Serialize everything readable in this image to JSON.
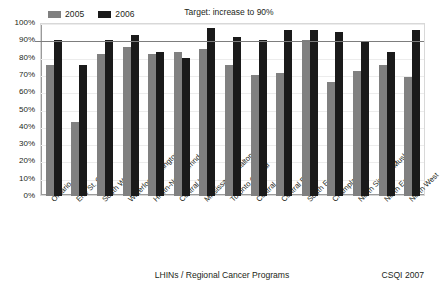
{
  "chart_data": {
    "type": "bar",
    "title": "",
    "annotation": "Target: increase to 90%",
    "xlabel": "LHINs / Regional Cancer Programs",
    "ylabel": "",
    "ylim": [
      0,
      100
    ],
    "ytick_labels": [
      "100%",
      "90%",
      "80%",
      "70%",
      "60%",
      "50%",
      "40%",
      "30%",
      "20%",
      "10%",
      "0%"
    ],
    "ytick_values": [
      100,
      90,
      80,
      70,
      60,
      50,
      40,
      30,
      20,
      10,
      0
    ],
    "grid": true,
    "legend_position": "top-left",
    "target_value": 90,
    "categories": [
      "Ontario",
      "Erie St. Clair",
      "South West",
      "Waterloo-Wellington",
      "Hmltn-Ngr-Hldmnd-Brnt",
      "Central West",
      "Mississauga Halton",
      "Toronto Central",
      "Central",
      "Central East",
      "South East",
      "Champlain",
      "North Simcoe Muskoka",
      "North East",
      "North West"
    ],
    "series": [
      {
        "name": "2005",
        "color": "#808080",
        "values": [
          76,
          43,
          82,
          86,
          82,
          83,
          85,
          76,
          70,
          71,
          90,
          66,
          72,
          76,
          69
        ]
      },
      {
        "name": "2006",
        "color": "#1a1a1a",
        "values": [
          90,
          76,
          90,
          93,
          83,
          80,
          97,
          92,
          90,
          96,
          96,
          95,
          89,
          83,
          96
        ]
      }
    ]
  },
  "footer": {
    "axis_title": "LHINs / Regional Cancer Programs",
    "source": "CSQI 2007"
  },
  "colors": {
    "series_2005": "#808080",
    "series_2006": "#1a1a1a",
    "target_line": "#7d7d7d",
    "gridline": "#ececec"
  }
}
